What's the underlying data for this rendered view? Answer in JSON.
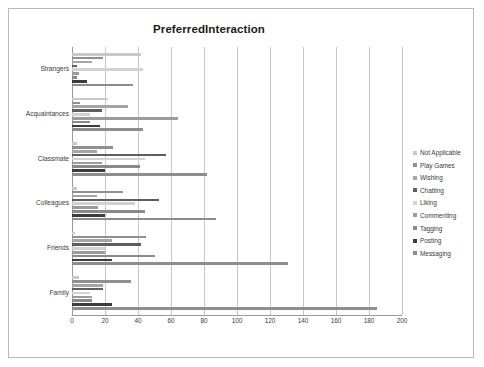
{
  "chart": {
    "title": "PreferredInteraction"
  },
  "legend": {
    "position": "right",
    "items": [
      {
        "label": "Not Applicable",
        "color": "#c9c9c9"
      },
      {
        "label": "Play Games",
        "color": "#8f8f8f"
      },
      {
        "label": "Wishing",
        "color": "#a5a5a5"
      },
      {
        "label": "Chatting",
        "color": "#5e5e5e"
      },
      {
        "label": "Liking",
        "color": "#d2d2d2"
      },
      {
        "label": "Commenting",
        "color": "#9b9b9b"
      },
      {
        "label": "Tagging",
        "color": "#8a8a8a"
      },
      {
        "label": "Posting",
        "color": "#3c3c3c"
      },
      {
        "label": "Messaging",
        "color": "#8d8d8d"
      }
    ]
  },
  "axis": {
    "x_ticks": [
      "0",
      "20",
      "40",
      "60",
      "80",
      "100",
      "120",
      "140",
      "160",
      "180",
      "200"
    ],
    "y_categories": [
      "Strangers",
      "Acquaintances",
      "Classmate",
      "Colleagues",
      "Friends",
      "Family"
    ]
  },
  "chart_data": {
    "type": "bar",
    "orientation": "horizontal",
    "title": "PreferredInteraction",
    "xlabel": "",
    "ylabel": "",
    "xlim": [
      0,
      200
    ],
    "xtick_step": 20,
    "grid": true,
    "legend_position": "right",
    "categories": [
      "Strangers",
      "Acquaintances",
      "Classmate",
      "Colleagues",
      "Friends",
      "Family"
    ],
    "series": [
      {
        "name": "Not Applicable",
        "color": "#c9c9c9",
        "values": [
          42,
          22,
          3,
          3,
          2,
          4
        ]
      },
      {
        "name": "Play Games",
        "color": "#8f8f8f",
        "values": [
          19,
          5,
          25,
          31,
          45,
          36
        ]
      },
      {
        "name": "Wishing",
        "color": "#a5a5a5",
        "values": [
          12,
          34,
          15,
          15,
          24,
          19
        ]
      },
      {
        "name": "Chatting",
        "color": "#5e5e5e",
        "values": [
          3,
          18,
          57,
          53,
          42,
          19
        ]
      },
      {
        "name": "Liking",
        "color": "#d2d2d2",
        "values": [
          43,
          11,
          44,
          38,
          20,
          11
        ]
      },
      {
        "name": "Commenting",
        "color": "#9b9b9b",
        "values": [
          4,
          64,
          18,
          16,
          20,
          12
        ]
      },
      {
        "name": "Tagging",
        "color": "#8a8a8a",
        "values": [
          3,
          11,
          41,
          44,
          50,
          12
        ]
      },
      {
        "name": "Posting",
        "color": "#3c3c3c",
        "values": [
          9,
          17,
          20,
          20,
          24,
          24
        ]
      },
      {
        "name": "Messaging",
        "color": "#8d8d8d",
        "values": [
          37,
          43,
          82,
          87,
          131,
          185
        ]
      }
    ]
  }
}
